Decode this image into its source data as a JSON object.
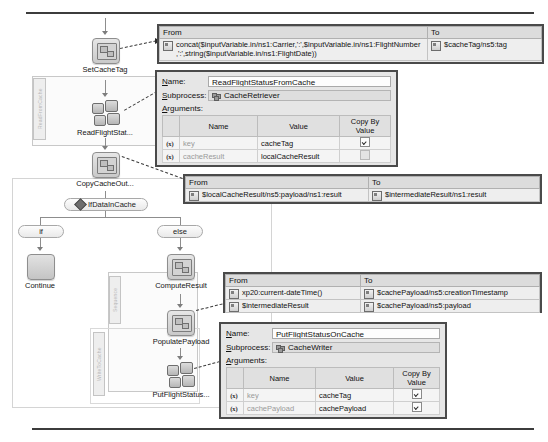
{
  "diagram": {
    "groups": [
      {
        "label": "ReadFromCache"
      },
      {
        "label": "Sequence"
      },
      {
        "label": "WriteToCache"
      }
    ],
    "nodes": [
      {
        "id": "set-cache-tag",
        "label": "SetCacheTag",
        "kind": "assign"
      },
      {
        "id": "read-flight-status",
        "label": "ReadFlightStat...",
        "kind": "subprocess"
      },
      {
        "id": "copy-cache-out",
        "label": "CopyCacheOut...",
        "kind": "assign"
      },
      {
        "id": "continue",
        "label": "Continue",
        "kind": "blank"
      },
      {
        "id": "compute-result",
        "label": "ComputeResult",
        "kind": "assign"
      },
      {
        "id": "populate-payload",
        "label": "PopulatePayload",
        "kind": "assign"
      },
      {
        "id": "put-flight-status",
        "label": "PutFlightStatus...",
        "kind": "subprocess"
      }
    ],
    "condition": {
      "label": "IfDataInCache"
    },
    "branches": [
      {
        "id": "if",
        "label": "if"
      },
      {
        "id": "else",
        "label": "else"
      }
    ]
  },
  "panels": {
    "set_cache_tag_mapping": {
      "from_header": "From",
      "to_header": "To",
      "rows": [
        {
          "from": "concat($inputVariable.in/ns1:Carrier,':',$inputVariable.in/ns1:FlightNumber\n,':',string($inputVariable.in/ns1:FlightDate))",
          "to": "$cacheTag/ns5:tag"
        }
      ]
    },
    "read_flight_status_form": {
      "name_label": "Name:",
      "name_value": "ReadFlightStatusFromCache",
      "subprocess_label": "Subprocess:",
      "subprocess_value": "CacheRetriever",
      "arguments_label": "Arguments:",
      "columns": [
        "",
        "Name",
        "Value",
        "Copy By Value"
      ],
      "rows": [
        {
          "name": "key",
          "value": "cacheTag",
          "copy_by_value": true
        },
        {
          "name": "cacheResult",
          "value": "localCacheResult",
          "copy_by_value": false
        }
      ]
    },
    "copy_cache_out_mapping": {
      "from_header": "From",
      "to_header": "To",
      "rows": [
        {
          "from": "$localCacheResult/ns5:payload/ns1:result",
          "to": "$intermediateResult/ns1:result"
        }
      ]
    },
    "populate_payload_mapping": {
      "from_header": "From",
      "to_header": "To",
      "rows": [
        {
          "from": "xp20:current-dateTime()",
          "to": "$cachePayload/ns5:creationTimestamp"
        },
        {
          "from": "$intermediateResult",
          "to": "$cachePayload/ns5:payload"
        }
      ]
    },
    "put_flight_status_form": {
      "name_label": "Name:",
      "name_value": "PutFlightStatusOnCache",
      "subprocess_label": "Subprocess:",
      "subprocess_value": "CacheWriter",
      "arguments_label": "Arguments:",
      "columns": [
        "",
        "Name",
        "Value",
        "Copy By Value"
      ],
      "rows": [
        {
          "name": "key",
          "value": "cacheTag",
          "copy_by_value": true
        },
        {
          "name": "cachePayload",
          "value": "cachePayload",
          "copy_by_value": true
        }
      ]
    }
  }
}
